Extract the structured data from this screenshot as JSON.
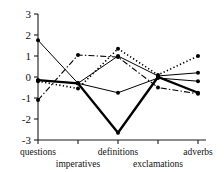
{
  "chart_data": {
    "type": "line",
    "title": "",
    "subtitle": "",
    "xlabel": "",
    "ylabel": "",
    "categories": [
      "questions",
      "imperatives",
      "definitions",
      "exclamations",
      "adverbs"
    ],
    "yticks": [
      3,
      2,
      1,
      0,
      -1,
      -2,
      -3
    ],
    "ytick_labels": [
      "3",
      "2",
      "1",
      "0",
      "-1",
      "-2",
      "-3"
    ],
    "ylim": [
      -3,
      3
    ],
    "xlim": [
      0.5,
      5.5
    ],
    "grid": false,
    "legend": "none",
    "series": [
      {
        "name": "series-1",
        "style": "solid-thick",
        "values": [
          -0.15,
          -0.3,
          -2.65,
          0.0,
          -0.75
        ]
      },
      {
        "name": "series-2",
        "style": "solid-thin",
        "values": [
          1.75,
          -0.3,
          -0.75,
          -0.05,
          -0.2
        ]
      },
      {
        "name": "series-3",
        "style": "dash-dot",
        "values": [
          -1.1,
          1.05,
          0.95,
          -0.5,
          -0.8
        ]
      },
      {
        "name": "series-4",
        "style": "dotted",
        "values": [
          -0.2,
          -0.55,
          1.35,
          0.1,
          1.0
        ]
      },
      {
        "name": "series-5",
        "style": "solid-thin",
        "values": [
          -0.15,
          -0.3,
          1.0,
          0.05,
          0.2
        ]
      }
    ]
  },
  "axes": {
    "y_axis_name": "y-axis",
    "x_axis_name": "x-axis"
  },
  "colors": {
    "ink": "#000000",
    "axis": "#1a1a1a",
    "background": "#ffffff"
  },
  "category_label_rows": [
    {
      "label": "questions",
      "row": 0,
      "index": 0
    },
    {
      "label": "imperatives",
      "row": 1,
      "index": 1
    },
    {
      "label": "definitions",
      "row": 0,
      "index": 2
    },
    {
      "label": "exclamations",
      "row": 1,
      "index": 3
    },
    {
      "label": "adverbs",
      "row": 0,
      "index": 4
    }
  ]
}
